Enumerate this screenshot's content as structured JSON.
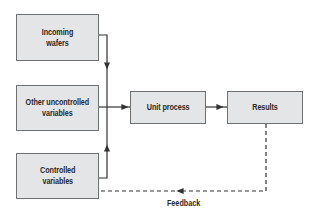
{
  "diagram": {
    "nodes": [
      {
        "id": "incoming",
        "label": "Incoming\nwafers"
      },
      {
        "id": "uncontrolled",
        "label": "Other uncontrolled\nvariables"
      },
      {
        "id": "controlled",
        "label": "Controlled\nvariables"
      },
      {
        "id": "unit",
        "label": "Unit process"
      },
      {
        "id": "results",
        "label": "Results"
      }
    ],
    "edges": [
      {
        "from": "incoming",
        "to": "unit",
        "style": "solid"
      },
      {
        "from": "uncontrolled",
        "to": "unit",
        "style": "solid"
      },
      {
        "from": "controlled",
        "to": "unit",
        "style": "solid"
      },
      {
        "from": "unit",
        "to": "results",
        "style": "solid"
      },
      {
        "from": "results",
        "to": "controlled",
        "style": "dashed",
        "label": "Feedback"
      }
    ],
    "feedback_label": "Feedback",
    "colors": {
      "box_fill": "#e4e5e6",
      "box_border": "#6f7072",
      "line": "#333333"
    }
  }
}
